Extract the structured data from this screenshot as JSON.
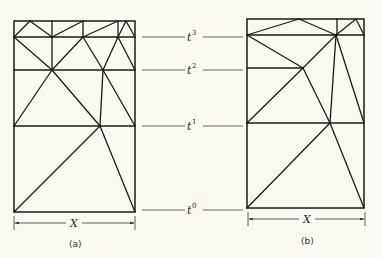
{
  "figure": {
    "time_levels": [
      {
        "label": "t",
        "sup": "3",
        "y": 37
      },
      {
        "label": "t",
        "sup": "2",
        "y": 70
      },
      {
        "label": "t",
        "sup": "1",
        "y": 126
      },
      {
        "label": "t",
        "sup": "0",
        "y": 212
      }
    ],
    "panels": [
      {
        "caption": "(a)",
        "dimension_label": "X"
      },
      {
        "caption": "(b)",
        "dimension_label": "X"
      }
    ]
  }
}
